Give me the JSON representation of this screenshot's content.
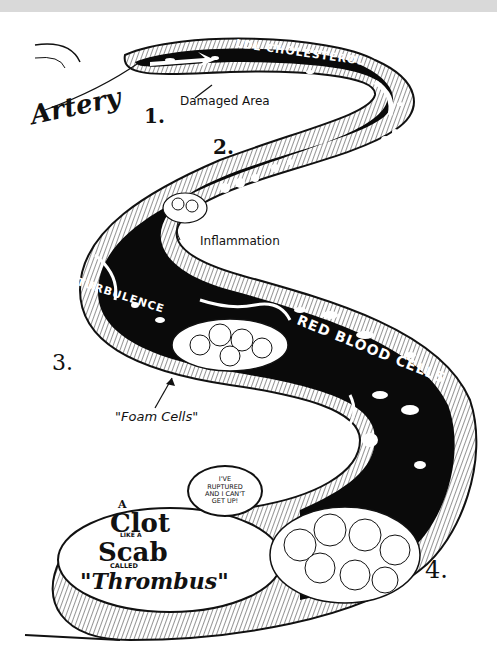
{
  "diagram": {
    "labels": {
      "artery": "Artery",
      "ldl": "LDL CHOLESTEROL",
      "damaged_area": "Damaged Area",
      "macrophages": "MACROPHAGES",
      "inflammation": "Inflammation",
      "turbulence": "TURBULENCE",
      "red_blood_cells": "RED BLOOD CELLS",
      "foam_cells": "\"Foam Cells\""
    },
    "steps": [
      "1.",
      "2.",
      "3.",
      "4."
    ],
    "speech_bubble": {
      "lines": [
        "I'VE",
        "RUPTURED",
        "AND I CAN'T",
        "GET UP!"
      ]
    },
    "clot_caption": {
      "line1": "A",
      "line2": "Clot",
      "line3": "LIKE A",
      "line4": "Scab",
      "line5": "CALLED",
      "line6": "\"Thrombus\""
    },
    "colors": {
      "lumen": "#0a0a0a",
      "wall": "#ffffff",
      "ink": "#111111",
      "topbar": "#d9d9d9"
    }
  }
}
